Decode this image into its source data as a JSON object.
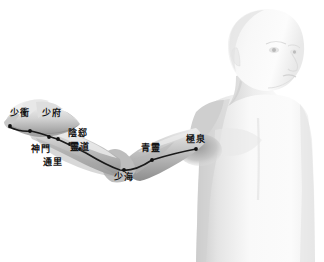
{
  "image": {
    "subject": "acupuncture-meridian-chart",
    "meridian_name": "手少陰心經",
    "background_color": "#ffffff",
    "line_color": "#1a1a1a",
    "point_color": "#111111",
    "skin_light": "#fbfbfb",
    "skin_mid": "#d8d8d8",
    "skin_shadow": "#8f8f8f"
  },
  "points": [
    {
      "name": "shaochong",
      "label": "少衝",
      "x": 10,
      "y": 108,
      "dot_x": 10,
      "dot_y": 126
    },
    {
      "name": "shaofu",
      "label": "少府",
      "x": 42,
      "y": 108,
      "dot_x": 30,
      "dot_y": 131
    },
    {
      "name": "shenmen",
      "label": "神門",
      "x": 31,
      "y": 144,
      "dot_x": 49,
      "dot_y": 137
    },
    {
      "name": "tongli",
      "label": "通里",
      "x": 43,
      "y": 157,
      "dot_x": 58,
      "dot_y": 139
    },
    {
      "name": "yinxi",
      "label": "陰郄",
      "x": 68,
      "y": 128,
      "dot_x": 70,
      "dot_y": 144
    },
    {
      "name": "lingdao",
      "label": "靈道",
      "x": 70,
      "y": 142,
      "dot_x": 80,
      "dot_y": 149
    },
    {
      "name": "shaohai",
      "label": "少海",
      "x": 114,
      "y": 172,
      "dot_x": 124,
      "dot_y": 170
    },
    {
      "name": "qingling",
      "label": "青靈",
      "x": 141,
      "y": 143,
      "dot_x": 152,
      "dot_y": 160
    },
    {
      "name": "jiquan",
      "label": "極泉",
      "x": 186,
      "y": 134,
      "dot_x": 196,
      "dot_y": 149
    }
  ],
  "meridian_path": {
    "description": "heart-meridian-line-from-little-finger-to-axilla",
    "d": "M 9,127 C 16,130 24,132 31,131 C 40,133 48,136 57,139 C 66,143 76,148 86,153 C 96,159 108,166 120,170 C 132,172 143,166 152,160 C 165,156 180,152 196,149"
  }
}
